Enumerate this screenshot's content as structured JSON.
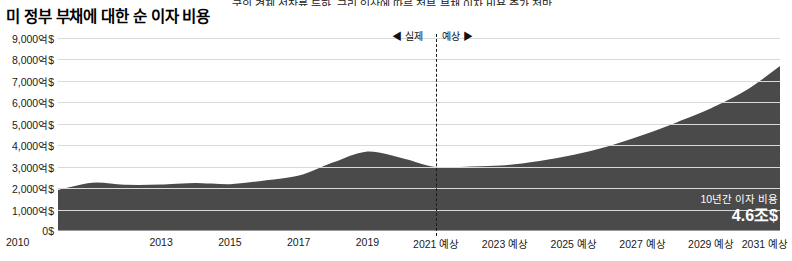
{
  "top_caption": "국의 경제 성장률 둔화, 금리 인상에 따른 정부 부채 이자 비용 증가 전망",
  "title": "미 정부 부채에 대한 순 이자 비용",
  "markers": {
    "actual": "◀ 실제",
    "projected": "예상 ▶"
  },
  "callout": {
    "label": "10년간 이자 비용",
    "value": "4.6조$"
  },
  "colors": {
    "area_fill": "#4a4a4a",
    "line": "#ffffff",
    "grid": "#d9d9d9",
    "axis": "#9a9a9a",
    "text": "#1a1a1a"
  },
  "chart_data": {
    "type": "area",
    "title": "미 정부 부채에 대한 순 이자 비용",
    "xlabel": "",
    "ylabel": "",
    "ylim": [
      0,
      900
    ],
    "yticks": [
      0,
      100,
      200,
      300,
      400,
      500,
      600,
      700,
      800,
      900
    ],
    "ytick_labels": [
      "0$",
      "1,000억$",
      "2,000억$",
      "3,000억$",
      "4,000억$",
      "5,000억$",
      "6,000억$",
      "7,000억$",
      "8,000억$",
      "9,000억$"
    ],
    "x": [
      2010,
      2011,
      2012,
      2013,
      2014,
      2015,
      2016,
      2017,
      2018,
      2019,
      2020,
      2021,
      2022,
      2023,
      2024,
      2025,
      2026,
      2027,
      2028,
      2029,
      2030,
      2031
    ],
    "xtick_labels": [
      "2010",
      "2013",
      "2015",
      "2017",
      "2019",
      "2021 예상",
      "2023 예상",
      "2025 예상",
      "2027 예상",
      "2029 예상",
      "2031 예상"
    ],
    "xticks": [
      2010,
      2013,
      2015,
      2017,
      2019,
      2021,
      2023,
      2025,
      2027,
      2029,
      2031
    ],
    "values": [
      196,
      230,
      220,
      221,
      229,
      223,
      240,
      263,
      325,
      375,
      345,
      303,
      306,
      311,
      331,
      360,
      400,
      452,
      512,
      578,
      660,
      775
    ],
    "series": [
      {
        "name": "순 이자 비용",
        "values": [
          196,
          230,
          220,
          221,
          229,
          223,
          240,
          263,
          325,
          375,
          345,
          303,
          306,
          311,
          331,
          360,
          400,
          452,
          512,
          578,
          660,
          775
        ]
      }
    ],
    "projection_start_year": 2021,
    "grid": true,
    "legend": "none",
    "annotations": [
      {
        "text": "◀ 실제",
        "x": 2021,
        "position": "left-of-divider"
      },
      {
        "text": "예상 ▶",
        "x": 2021,
        "position": "right-of-divider"
      },
      {
        "text": "10년간 이자 비용 4.6조$",
        "x": 2029,
        "y": 150
      }
    ]
  }
}
